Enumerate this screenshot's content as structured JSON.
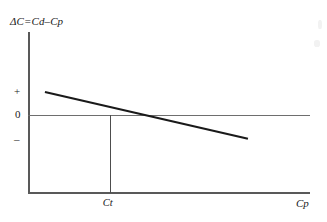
{
  "chart_data": {
    "type": "line",
    "title": "",
    "ylabel": "ΔC=Cd–Cp",
    "xlabel": "Cp",
    "ytick_labels": [
      "+",
      "0",
      "–"
    ],
    "xtick_labels": [
      "Ct"
    ],
    "grid": false,
    "legend": null,
    "zero_reference_line": true,
    "series": [
      {
        "name": "ΔC",
        "x": [
          0.06,
          0.78
        ],
        "y": [
          0.295,
          -0.305
        ],
        "comment_shape": "straight downward-sloping line crossing zero at Ct",
        "color": "#1a1a1a",
        "width_px": 2.2
      }
    ],
    "annotations": [
      {
        "name": "ct-drop-line",
        "label": "Ct",
        "x": 0.29,
        "from_y": 0.0,
        "to_y": -1.0
      }
    ],
    "zero_crossing": {
      "x": 0.29,
      "y": 0.0,
      "label": "Ct"
    },
    "xlim": [
      0,
      1
    ],
    "ylim": [
      -1,
      1
    ]
  },
  "axes": {
    "y_title": "ΔC=Cd–Cp",
    "x_title": "Cp",
    "y_ticks": {
      "positive": "+",
      "zero": "0",
      "negative": "–"
    },
    "x_ticks": {
      "threshold": "Ct"
    }
  },
  "colors": {
    "axis": "#595959",
    "zero_line": "#6e6e6e",
    "drop_line": "#4d4d4d",
    "data_line": "#1a1a1a",
    "background": "#ffffff",
    "text": "#1a1a1a"
  }
}
